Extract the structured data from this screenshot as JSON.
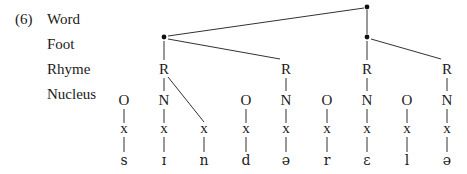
{
  "example_number": "(6)",
  "tier_labels": [
    {
      "text": "Word",
      "y": 19
    },
    {
      "text": "Foot",
      "y": 44
    },
    {
      "text": "Rhyme",
      "y": 69
    },
    {
      "text": "Nucleus",
      "y": 94
    }
  ],
  "word_node": {
    "x": 367,
    "y": 7,
    "symbol": "•"
  },
  "feet": [
    {
      "x": 164,
      "y": 37,
      "symbol": "•"
    },
    {
      "x": 367,
      "y": 37,
      "symbol": "•"
    }
  ],
  "rhymes": [
    {
      "label": "R",
      "x": 164,
      "y": 69,
      "foot": 0
    },
    {
      "label": "R",
      "x": 286,
      "y": 69,
      "foot": 0
    },
    {
      "label": "R",
      "x": 367,
      "y": 69,
      "foot": 1
    },
    {
      "label": "R",
      "x": 447,
      "y": 69,
      "foot": 1
    }
  ],
  "columns": [
    {
      "x": 124,
      "top": "O",
      "skeleton": "x",
      "segment": "s",
      "rhyme": null
    },
    {
      "x": 164,
      "top": "N",
      "skeleton": "x",
      "segment": "ɪ",
      "rhyme": 0
    },
    {
      "x": 204,
      "top": "",
      "skeleton": "x",
      "segment": "n",
      "rhyme": 0,
      "coda": true
    },
    {
      "x": 246,
      "top": "O",
      "skeleton": "x",
      "segment": "d",
      "rhyme": null
    },
    {
      "x": 286,
      "top": "N",
      "skeleton": "x",
      "segment": "ə",
      "rhyme": 1
    },
    {
      "x": 327,
      "top": "O",
      "skeleton": "x",
      "segment": "r",
      "rhyme": null
    },
    {
      "x": 367,
      "top": "N",
      "skeleton": "x",
      "segment": "ɛ",
      "rhyme": 2
    },
    {
      "x": 407,
      "top": "O",
      "skeleton": "x",
      "segment": "l",
      "rhyme": null
    },
    {
      "x": 447,
      "top": "N",
      "skeleton": "x",
      "segment": "ə",
      "rhyme": 3
    }
  ],
  "rows": {
    "nucleus_y": 100,
    "skeleton_y": 130,
    "segment_y": 160
  },
  "colors": {
    "ink": "#1a1a1a",
    "line": "#333333",
    "background": "#ffffff"
  }
}
